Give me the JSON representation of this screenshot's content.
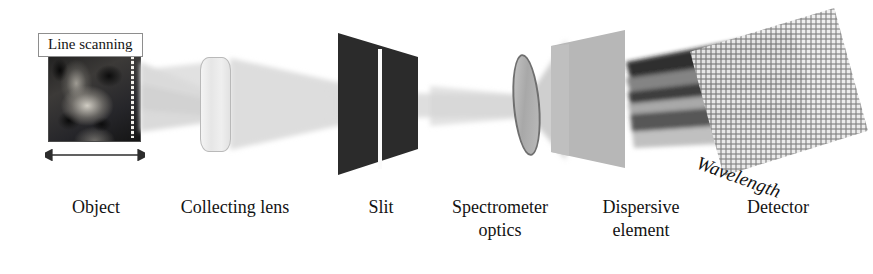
{
  "figure": {
    "background_color": "#ffffff",
    "ink_color": "#131313"
  },
  "annotations": {
    "scan_label": "Line scanning",
    "axis_label": "Wavelength",
    "scan_arrow": "double-headed-horizontal-arrow"
  },
  "components": [
    {
      "id": "object",
      "label": "Object",
      "caption_x": 46,
      "caption_width": 100
    },
    {
      "id": "collecting-lens",
      "label": "Collecting lens",
      "caption_x": 155,
      "caption_width": 160
    },
    {
      "id": "slit",
      "label": "Slit",
      "caption_x": 333,
      "caption_width": 96
    },
    {
      "id": "spectrometer-optics",
      "label": "Spectrometer\noptics",
      "caption_x": 430,
      "caption_width": 140
    },
    {
      "id": "dispersive-element",
      "label": "Dispersive\nelement",
      "caption_x": 576,
      "caption_width": 130
    },
    {
      "id": "detector",
      "label": "Detector",
      "caption_x": 718,
      "caption_width": 120
    }
  ],
  "colors": {
    "slit_dark": "#2b2b2b",
    "dispersive_gray": "#b5b5b5",
    "beam_gray": "#d9d9d9",
    "detector_grid": "#c8c8c8",
    "lens_outline": "#6f6f6f",
    "label_border": "#8e8e8e"
  }
}
